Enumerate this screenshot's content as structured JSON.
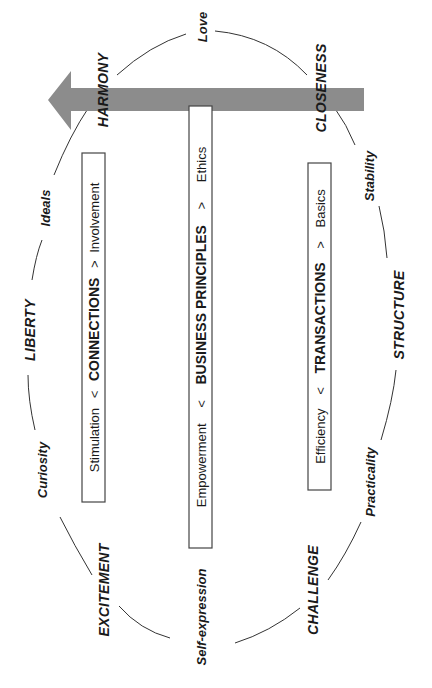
{
  "diagram": {
    "orientation": "rotated-90-ccw",
    "arrow": {
      "color": "#8c8c8c",
      "direction": "toward LIBERTY"
    },
    "ring_labels": {
      "love": "Love",
      "harmony": "HARMONY",
      "closeness": "CLOSENESS",
      "ideals": "Ideals",
      "stability": "Stability",
      "liberty": "LIBERTY",
      "structure": "STRUCTURE",
      "curiosity": "Curiosity",
      "practicality": "Practicality",
      "excitement": "EXCITEMENT",
      "challenge": "CHALLENGE",
      "self_expression": "Self-expression"
    },
    "boxes": [
      {
        "left": "Stimulation",
        "lt": "<",
        "center": "CONNECTIONS",
        "gt": ">",
        "right": "Involvement"
      },
      {
        "left": "Empowerment",
        "lt": "<",
        "center": "BUSINESS PRINCIPLES",
        "gt": ">",
        "right": "Ethics"
      },
      {
        "left": "Efficiency",
        "lt": "<",
        "center": "TRANSACTIONS",
        "gt": ">",
        "right": "Basics"
      }
    ]
  }
}
